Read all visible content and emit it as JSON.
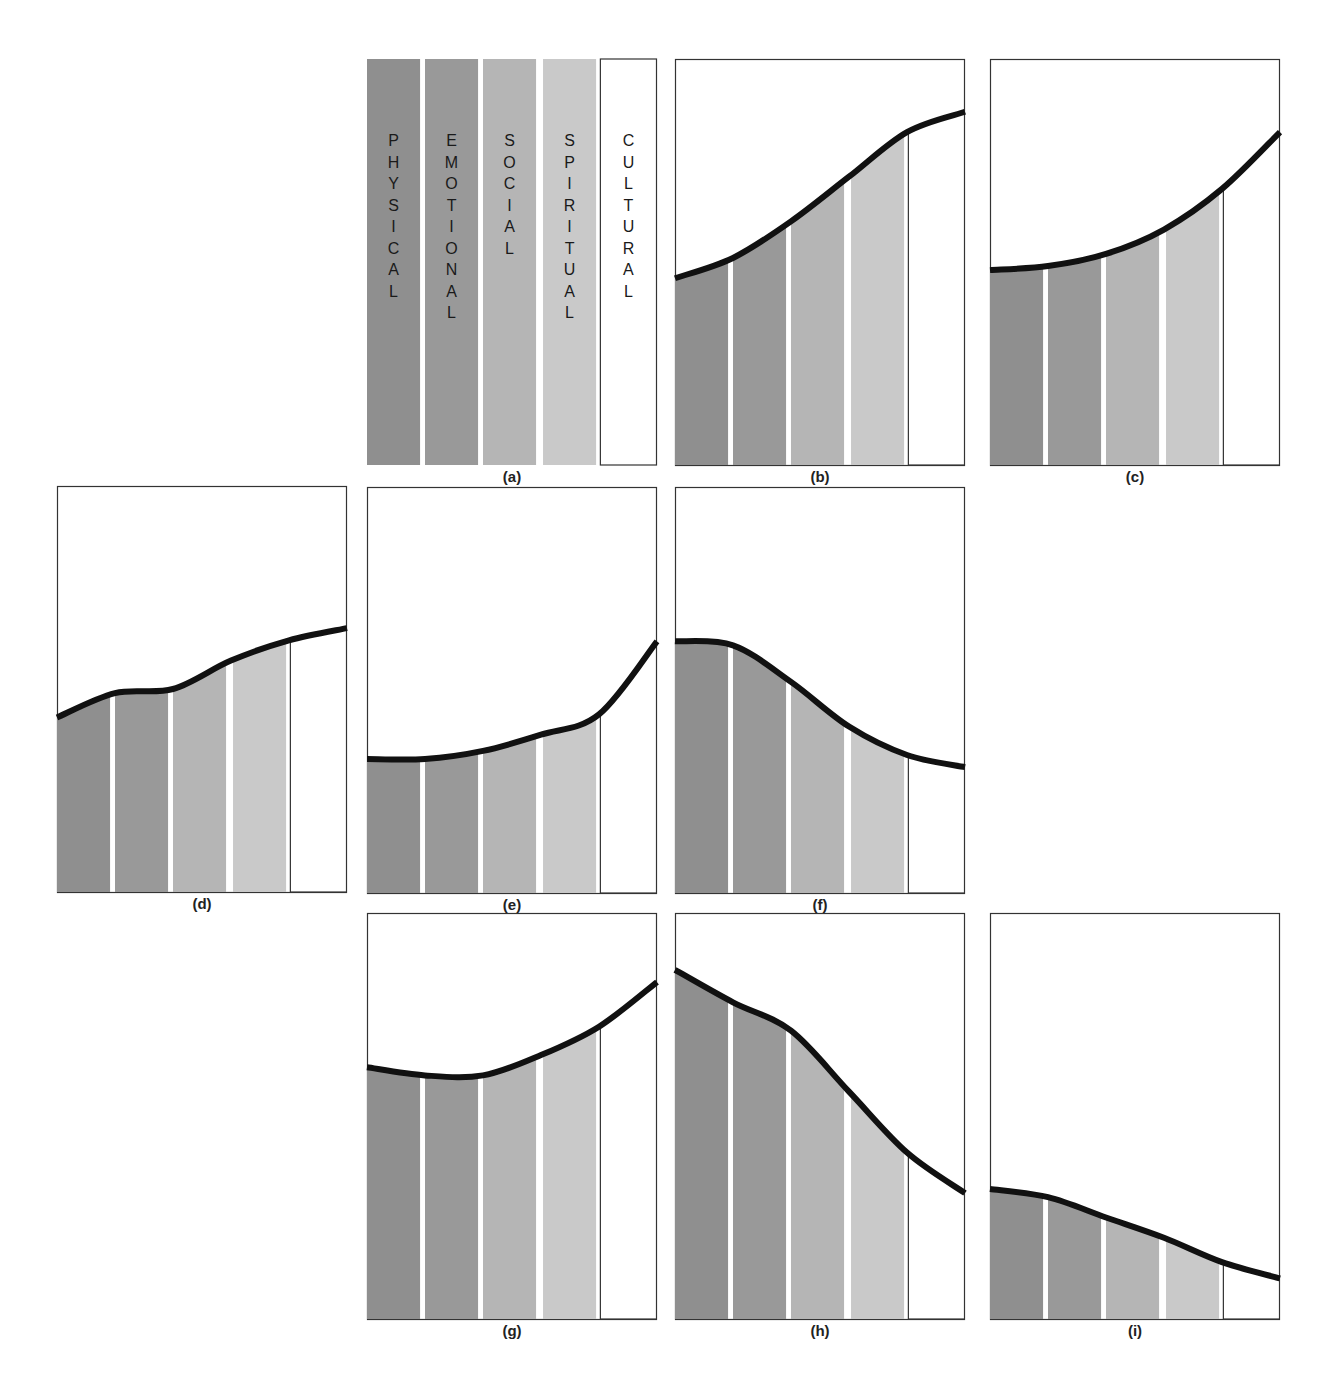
{
  "figure": {
    "dimensions": [
      {
        "key": "physical",
        "label": "PHYSICAL",
        "color": "#8f8f8f"
      },
      {
        "key": "emotional",
        "label": "EMOTIONAL",
        "color": "#999999"
      },
      {
        "key": "social",
        "label": "SOCIAL",
        "color": "#b5b5b5"
      },
      {
        "key": "spiritual",
        "label": "SPIRITUAL",
        "color": "#c9c9c9"
      },
      {
        "key": "cultural",
        "label": "CULTURAL",
        "color": "#ffffff"
      }
    ],
    "curve_color": "#111111",
    "border_color": "#333333"
  },
  "chart_data": {
    "type": "area",
    "title": "",
    "xlabel": "",
    "ylabel": "",
    "ylim": [
      0,
      1
    ],
    "grid": false,
    "categories": [
      "PHYSICAL",
      "EMOTIONAL",
      "SOCIAL",
      "SPIRITUAL",
      "CULTURAL"
    ],
    "curve_sample_x": [
      0,
      0.2,
      0.4,
      0.6,
      0.8,
      1.0
    ],
    "panels": [
      {
        "id": "a",
        "label": "(a)",
        "show_letters": true,
        "curve": null
      },
      {
        "id": "b",
        "label": "(b)",
        "show_letters": false,
        "curve": [
          0.46,
          0.51,
          0.6,
          0.71,
          0.82,
          0.87
        ]
      },
      {
        "id": "c",
        "label": "(c)",
        "show_letters": false,
        "curve": [
          0.48,
          0.49,
          0.52,
          0.58,
          0.68,
          0.82
        ]
      },
      {
        "id": "d",
        "label": "(d)",
        "show_letters": false,
        "curve": [
          0.43,
          0.49,
          0.5,
          0.57,
          0.62,
          0.65
        ]
      },
      {
        "id": "e",
        "label": "(e)",
        "show_letters": false,
        "curve": [
          0.33,
          0.33,
          0.35,
          0.39,
          0.44,
          0.62
        ]
      },
      {
        "id": "f",
        "label": "(f)",
        "show_letters": false,
        "curve": [
          0.62,
          0.61,
          0.52,
          0.41,
          0.34,
          0.31
        ]
      },
      {
        "id": "g",
        "label": "(g)",
        "show_letters": false,
        "curve": [
          0.62,
          0.6,
          0.6,
          0.65,
          0.72,
          0.83
        ]
      },
      {
        "id": "h",
        "label": "(h)",
        "show_letters": false,
        "curve": [
          0.86,
          0.78,
          0.71,
          0.56,
          0.41,
          0.31
        ]
      },
      {
        "id": "i",
        "label": "(i)",
        "show_letters": false,
        "curve": [
          0.32,
          0.3,
          0.25,
          0.2,
          0.14,
          0.1
        ]
      }
    ]
  }
}
